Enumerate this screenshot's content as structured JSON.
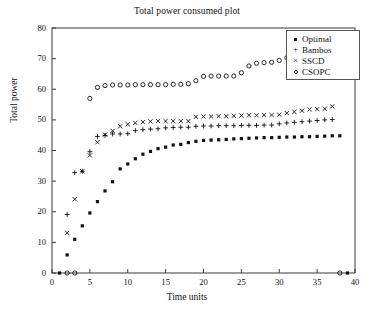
{
  "chart_data": {
    "type": "scatter",
    "title": "Total power consumed plot",
    "xlabel": "Time units",
    "ylabel": "Total power",
    "xlim": [
      0,
      40
    ],
    "ylim": [
      0,
      80
    ],
    "xticks": [
      0,
      5,
      10,
      15,
      20,
      25,
      30,
      35,
      40
    ],
    "yticks": [
      0,
      10,
      20,
      30,
      40,
      50,
      60,
      70,
      80
    ],
    "grid": false,
    "legend_position": "top-right",
    "marker_color": "#111111",
    "series": [
      {
        "name": "Optimal",
        "marker": "filled-square",
        "x": [
          1,
          2,
          3,
          4,
          5,
          6,
          7,
          8,
          9,
          10,
          11,
          12,
          13,
          14,
          15,
          16,
          17,
          18,
          19,
          20,
          21,
          22,
          23,
          24,
          25,
          26,
          27,
          28,
          29,
          30,
          31,
          32,
          33,
          34,
          35,
          36,
          37,
          38,
          39
        ],
        "y": [
          0,
          5.9,
          11.0,
          15.4,
          19.6,
          23.3,
          26.8,
          29.8,
          34.0,
          35.6,
          37.3,
          38.8,
          39.7,
          40.6,
          41.1,
          41.8,
          42.0,
          42.6,
          43.0,
          43.3,
          43.4,
          43.5,
          43.6,
          43.8,
          43.9,
          44.0,
          44.1,
          44.2,
          44.2,
          44.3,
          44.4,
          44.4,
          44.5,
          44.5,
          44.6,
          44.7,
          44.8,
          44.8,
          0
        ]
      },
      {
        "name": "Bambos",
        "marker": "plus",
        "x": [
          2,
          3,
          4,
          5,
          6,
          7,
          8,
          9,
          10,
          11,
          12,
          13,
          14,
          15,
          16,
          17,
          18,
          19,
          20,
          21,
          22,
          23,
          24,
          25,
          26,
          27,
          28,
          29,
          30,
          31,
          32,
          33,
          34,
          35,
          36,
          37
        ],
        "y": [
          19.1,
          32.8,
          33.2,
          39.6,
          44.6,
          44.9,
          45.4,
          45.4,
          45.5,
          46.5,
          46.8,
          47.0,
          47.1,
          47.4,
          47.5,
          47.6,
          47.6,
          47.9,
          48.0,
          48.0,
          48.1,
          48.1,
          48.1,
          48.2,
          48.2,
          48.2,
          48.3,
          48.3,
          48.7,
          49.0,
          49.2,
          49.4,
          49.6,
          49.8,
          50.0,
          50.1
        ]
      },
      {
        "name": "SSCD",
        "marker": "cross",
        "x": [
          2,
          3,
          4,
          5,
          6,
          7,
          8,
          9,
          10,
          11,
          12,
          13,
          14,
          15,
          16,
          17,
          18,
          19,
          20,
          21,
          22,
          23,
          24,
          25,
          26,
          27,
          28,
          29,
          30,
          31,
          32,
          33,
          34,
          35,
          36,
          37
        ],
        "y": [
          13.1,
          24.1,
          33.2,
          38.4,
          42.7,
          45.2,
          46.4,
          47.9,
          48.6,
          49.0,
          49.3,
          49.5,
          49.6,
          49.6,
          49.6,
          49.6,
          49.6,
          51.0,
          51.1,
          51.1,
          51.2,
          51.2,
          51.3,
          51.4,
          51.5,
          51.5,
          51.6,
          51.6,
          51.7,
          52.2,
          52.6,
          53.0,
          53.4,
          53.5,
          53.6,
          54.4
        ]
      },
      {
        "name": "CSOPC",
        "marker": "circle",
        "x": [
          2,
          3,
          5,
          6,
          7,
          8,
          9,
          10,
          11,
          12,
          13,
          14,
          15,
          16,
          17,
          18,
          19,
          20,
          21,
          22,
          23,
          24,
          25,
          26,
          27,
          28,
          29,
          30,
          31,
          32,
          38
        ],
        "y": [
          0,
          0,
          57.0,
          60.6,
          61.2,
          61.4,
          61.4,
          61.4,
          61.5,
          61.5,
          61.5,
          61.5,
          61.5,
          61.6,
          61.6,
          61.8,
          62.8,
          64.2,
          64.3,
          64.3,
          64.3,
          64.3,
          65.4,
          67.6,
          68.5,
          68.7,
          68.8,
          69.4,
          70.3,
          72.5,
          0
        ]
      }
    ]
  },
  "legend": {
    "items": [
      {
        "label": "Optimal",
        "marker": "filled-square"
      },
      {
        "label": "Bambos",
        "marker": "plus"
      },
      {
        "label": "SSCD",
        "marker": "cross"
      },
      {
        "label": "CSOPC",
        "marker": "circle"
      }
    ]
  }
}
